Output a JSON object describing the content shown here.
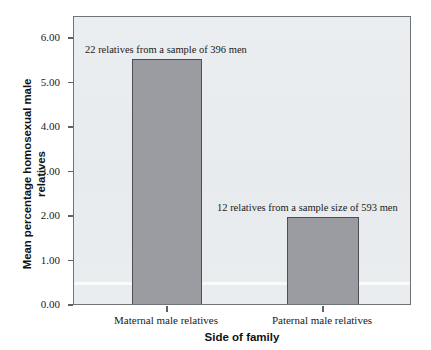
{
  "chart_data": {
    "type": "bar",
    "title": "",
    "xlabel": "Side of family",
    "ylabel": "Mean percentage homosexual male relatives",
    "categories": [
      "Maternal male relatives",
      "Paternal male relatives"
    ],
    "values": [
      5.55,
      2.0
    ],
    "ylim": [
      0.0,
      6.5
    ],
    "yticks": [
      "0.00",
      "1.00",
      "2.00",
      "3.00",
      "4.00",
      "5.00",
      "6.00"
    ],
    "ytick_values": [
      0,
      1,
      2,
      3,
      4,
      5,
      6
    ],
    "grid": false,
    "legend": false,
    "bar_color": "#9a9ca1",
    "bar_edge_color": "#4c5055",
    "panel_color": "#e9edef",
    "frame_color": "#6f7479",
    "annotations": [
      {
        "text": "22 relatives from a sample of 396 men",
        "series_index": 0
      },
      {
        "text": "12 relatives from a sample size of 593 men",
        "series_index": 1
      }
    ]
  },
  "axes": {
    "y_title_line1": "Mean percentage homosexual male",
    "y_title_line2": "relatives",
    "x_title": "Side of family"
  }
}
